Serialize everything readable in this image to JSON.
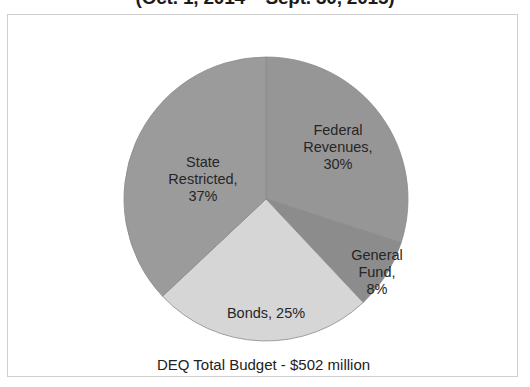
{
  "chart_data": {
    "type": "pie",
    "title": "(Oct. 1, 2014 – Sept. 30, 2015)",
    "caption": "DEQ Total Budget - $502 million",
    "xlabel": "",
    "ylabel": "",
    "legend_position": "none",
    "grid": false,
    "start_angle_deg": 0,
    "direction": "clockwise",
    "total_label": "$502 million",
    "categories": [
      "Federal Revenues",
      "General Fund",
      "Bonds",
      "State Restricted"
    ],
    "values": [
      30,
      8,
      25,
      37
    ],
    "units": "percent",
    "slices": [
      {
        "name": "Federal Revenues",
        "value": 30,
        "value_label": "30%",
        "label": "Federal\nRevenues,\n30%",
        "color": "#969696",
        "start_deg": 0,
        "end_deg": 108
      },
      {
        "name": "General Fund",
        "value": 8,
        "value_label": "8%",
        "label": "General\nFund,\n8%",
        "color": "#8c8c8c",
        "start_deg": 108,
        "end_deg": 136.8
      },
      {
        "name": "Bonds",
        "value": 25,
        "value_label": "25%",
        "label": "Bonds, 25%",
        "color": "#d6d6d6",
        "start_deg": 136.8,
        "end_deg": 226.8
      },
      {
        "name": "State Restricted",
        "value": 37,
        "value_label": "37%",
        "label": "State\nRestricted,\n37%",
        "color": "#9b9b9b",
        "start_deg": 226.8,
        "end_deg": 360
      }
    ]
  },
  "frame": {
    "border_color": "#cfcfcf",
    "background": "#ffffff"
  }
}
